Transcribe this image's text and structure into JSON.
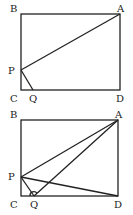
{
  "figures": [
    {
      "name": "figure-1",
      "points": {
        "A": [
          120,
          14
        ],
        "B": [
          21,
          14
        ],
        "C": [
          21,
          90
        ],
        "D": [
          120,
          90
        ],
        "P": [
          21,
          70
        ],
        "Q": [
          33,
          90
        ]
      },
      "labels": {
        "A": "A",
        "B": "B",
        "C": "C",
        "D": "D",
        "P": "P",
        "Q": "Q"
      },
      "segments": [
        [
          "B",
          "A"
        ],
        [
          "A",
          "D"
        ],
        [
          "D",
          "C"
        ],
        [
          "C",
          "B"
        ],
        [
          "P",
          "A"
        ],
        [
          "P",
          "Q"
        ]
      ]
    },
    {
      "name": "figure-2",
      "points": {
        "A": [
          118,
          120
        ],
        "B": [
          21,
          120
        ],
        "C": [
          21,
          196
        ],
        "D": [
          118,
          196
        ],
        "P": [
          21,
          177
        ],
        "Q": [
          34,
          196
        ]
      },
      "labels": {
        "A": "A",
        "B": "B",
        "C": "C",
        "D": "D",
        "P": "P",
        "Q": "Q"
      },
      "segments": [
        [
          "B",
          "A"
        ],
        [
          "A",
          "D"
        ],
        [
          "D",
          "C"
        ],
        [
          "C",
          "B"
        ],
        [
          "P",
          "A"
        ],
        [
          "P",
          "Q"
        ],
        [
          "P",
          "D"
        ],
        [
          "Q",
          "A"
        ]
      ]
    }
  ]
}
